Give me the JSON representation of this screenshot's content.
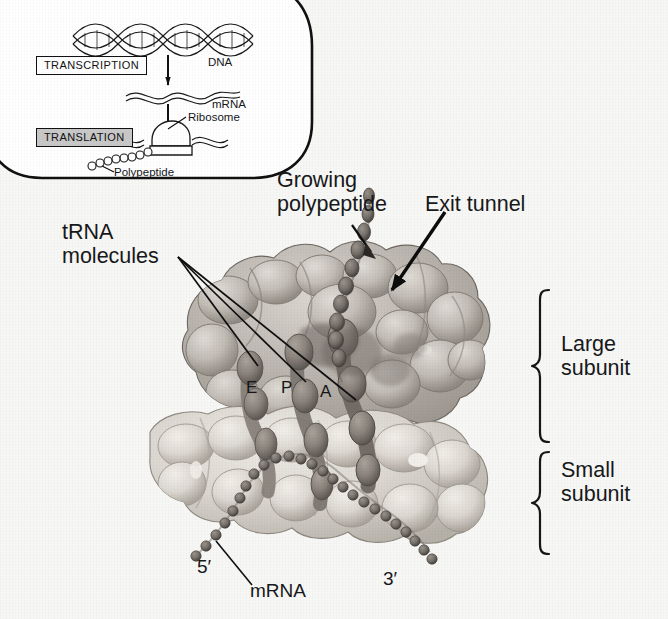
{
  "figure": {
    "background_color": "#f7f7f5",
    "width": 668,
    "height": 619
  },
  "inset": {
    "name": "transcription-translation-overview",
    "border_color": "#111111",
    "background_color": "#ffffff",
    "transcription_label": "TRANSCRIPTION",
    "translation_label": "TRANSLATION",
    "translation_shaded": true,
    "labels": {
      "dna": "DNA",
      "mrna": "mRNA",
      "ribosome": "Ribosome",
      "polypeptide": "Polypeptide"
    }
  },
  "callouts": {
    "growing_polypeptide": "Growing\npolypeptide",
    "growing_polypeptide_line1": "Growing",
    "growing_polypeptide_line2": "polypeptide",
    "exit_tunnel": "Exit tunnel",
    "trna_molecules_line1": "tRNA",
    "trna_molecules_line2": "molecules",
    "large_subunit_line1": "Large",
    "large_subunit_line2": "subunit",
    "small_subunit_line1": "Small",
    "small_subunit_line2": "subunit",
    "five_prime": "5′",
    "three_prime": "3′",
    "mrna": "mRNA"
  },
  "sites": {
    "e_site": "E",
    "p_site": "P",
    "a_site": "A"
  },
  "colors": {
    "large_subunit": "#b9b4ae",
    "small_subunit": "#d8d4cd",
    "trna": "#8d8680",
    "polypeptide_chain": "#6f6a66",
    "mrna_chain": "#7d7872",
    "leader_line": "#101010",
    "arrow": "#0c0c0c",
    "bracket": "#161616",
    "text": "#16181a"
  }
}
